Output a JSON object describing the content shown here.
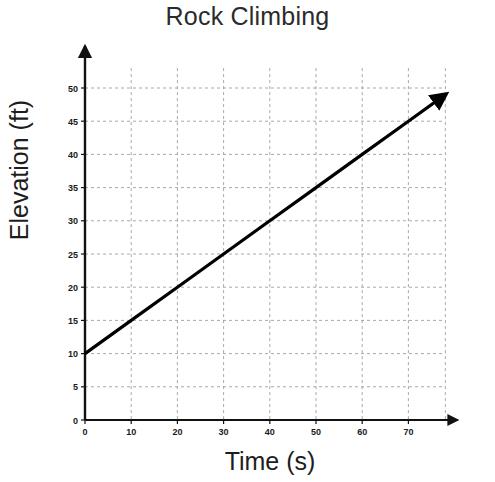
{
  "chart_data": {
    "type": "line",
    "title": "Rock Climbing",
    "xlabel": "Time (s)",
    "ylabel": "Elevation (ft)",
    "xlim": [
      0,
      78
    ],
    "ylim": [
      0,
      53
    ],
    "xticks": [
      0,
      10,
      20,
      30,
      40,
      50,
      60,
      70
    ],
    "yticks": [
      0,
      5,
      10,
      15,
      20,
      25,
      30,
      35,
      40,
      45,
      50
    ],
    "grid": true,
    "legend": "none",
    "series": [
      {
        "name": "Elevation",
        "color": "#000000",
        "x": [
          0,
          10,
          20,
          30,
          40,
          50,
          60,
          70,
          78
        ],
        "values": [
          10,
          15,
          20,
          25,
          30,
          35,
          40,
          45,
          49
        ],
        "slope": 0.5,
        "intercept": 10,
        "arrow_end": true
      }
    ],
    "annotations": []
  },
  "axes": {
    "x_axis_name": "x-axis",
    "y_axis_name": "y-axis",
    "x_arrow": true,
    "y_arrow": true
  }
}
